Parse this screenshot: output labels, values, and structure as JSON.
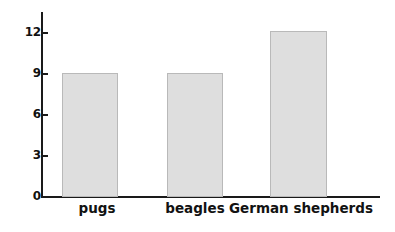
{
  "chart_data": {
    "type": "bar",
    "title": "",
    "xlabel": "",
    "ylabel": "",
    "categories": [
      "pugs",
      "beagles",
      "German shepherds"
    ],
    "values": [
      9,
      9,
      12.1
    ],
    "ylim": [
      0,
      13.5
    ],
    "yticks": [
      0,
      3,
      6,
      9,
      12
    ],
    "ytick_labels": [
      "0",
      "3",
      "6",
      "9",
      "12"
    ],
    "grid": false,
    "legend": null,
    "series": [
      {
        "name": "count",
        "values": [
          9,
          9,
          12.1
        ]
      }
    ],
    "colors": {
      "bar_fill": "#dedede",
      "bar_border": "#b9b9b9",
      "axis": "#1a1a1a",
      "text": "#121212",
      "background": "#ffffff"
    }
  },
  "axis": {
    "y_ticks": [
      {
        "label": "12",
        "value": 12
      },
      {
        "label": "9",
        "value": 9
      },
      {
        "label": "6",
        "value": 6
      },
      {
        "label": "3",
        "value": 3
      },
      {
        "label": "0",
        "value": 0
      }
    ]
  },
  "bars": [
    {
      "label": "pugs",
      "value": 9
    },
    {
      "label": "beagles",
      "value": 9
    },
    {
      "label": "German shepherds",
      "value": 12.1
    }
  ]
}
